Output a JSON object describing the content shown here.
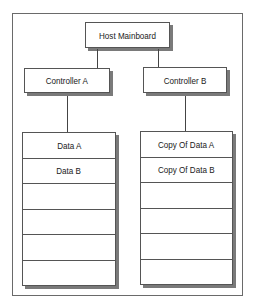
{
  "diagram": {
    "host": {
      "label": "Host Mainboard"
    },
    "controllers": [
      {
        "label": "Controller A"
      },
      {
        "label": "Controller B"
      }
    ],
    "stacks": [
      {
        "controller": "Controller A",
        "rows": [
          "Data A",
          "Data B",
          "",
          "",
          "",
          ""
        ]
      },
      {
        "controller": "Controller B",
        "rows": [
          "Copy Of Data A",
          "Copy Of Data B",
          "",
          "",
          "",
          ""
        ]
      }
    ],
    "colors": {
      "border": "#555555",
      "shadow": "#7a7a7a",
      "frame": "#6a6a6a",
      "background": "#ffffff"
    }
  }
}
